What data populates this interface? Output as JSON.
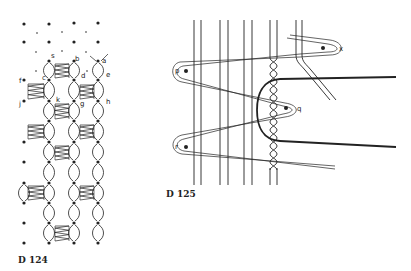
{
  "figures": [
    {
      "id": "D 124",
      "caption": "D 124",
      "point_labels": [
        "a",
        "b",
        "c",
        "d",
        "e",
        "f",
        "g",
        "h",
        "j",
        "k",
        "s"
      ]
    },
    {
      "id": "D 125",
      "caption": "D 125",
      "point_labels": [
        "p",
        "q",
        "r",
        "x"
      ]
    }
  ],
  "colors": {
    "ink": "#222222",
    "background": "#ffffff"
  }
}
